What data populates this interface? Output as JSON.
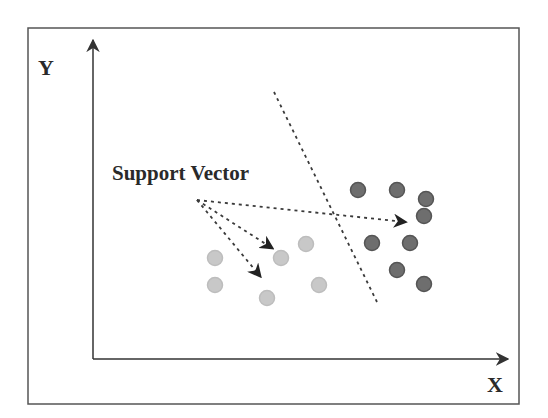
{
  "diagram": {
    "labels": {
      "y_axis": "Y",
      "x_axis": "X",
      "annotation": "Support Vector"
    },
    "colors": {
      "frame": "#555555",
      "axis": "#333333",
      "dashed": "#3a3a3a",
      "class_a": "#6e6e6e",
      "class_a_stroke": "#555555",
      "class_b": "#c8c8c8",
      "class_b_stroke": "#bdbdbd",
      "text": "#2a2a2a"
    },
    "frame": {
      "x": 28,
      "y": 28,
      "w": 491,
      "h": 376
    },
    "axes": {
      "origin": [
        93,
        359
      ],
      "y_top": [
        93,
        40
      ],
      "x_right": [
        508,
        359
      ]
    },
    "boundary": {
      "from": [
        274,
        92
      ],
      "to": [
        377,
        302
      ]
    },
    "arrow_origin": [
      197,
      200
    ],
    "arrows": [
      {
        "to": [
          405,
          222
        ]
      },
      {
        "to": [
          272,
          248
        ]
      },
      {
        "to": [
          260,
          276
        ]
      }
    ],
    "class_a_points": [
      [
        358,
        190
      ],
      [
        397,
        190
      ],
      [
        426,
        199
      ],
      [
        424,
        216
      ],
      [
        372,
        243
      ],
      [
        410,
        243
      ],
      [
        397,
        270
      ],
      [
        424,
        284
      ]
    ],
    "class_b_points": [
      [
        215,
        258
      ],
      [
        281,
        258
      ],
      [
        306,
        244
      ],
      [
        215,
        285
      ],
      [
        267,
        298
      ],
      [
        319,
        285
      ]
    ],
    "point_radius": 7.5
  }
}
